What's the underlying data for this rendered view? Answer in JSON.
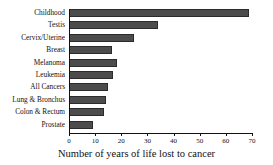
{
  "chart_data": {
    "type": "bar",
    "orientation": "horizontal",
    "title": "",
    "xlabel": "Number of years of life lost to cancer",
    "ylabel": "",
    "xlim": [
      0,
      70
    ],
    "xticks": [
      0,
      10,
      20,
      30,
      40,
      50,
      60,
      70
    ],
    "grid": false,
    "legend": null,
    "bar_color": "#4c4c4c",
    "bar_edge_color": "#2b2b2b",
    "axis_color": "#111111",
    "categories": [
      "Childhood",
      "Testis",
      "Cervix/Uterine",
      "Breast",
      "Melanoma",
      "Leukemia",
      "All Cancers",
      "Lung & Bronchus",
      "Colon & Rectum",
      "Prostate"
    ],
    "values": [
      69,
      34,
      25,
      16.5,
      18.5,
      17,
      15,
      14,
      13.5,
      9
    ]
  }
}
